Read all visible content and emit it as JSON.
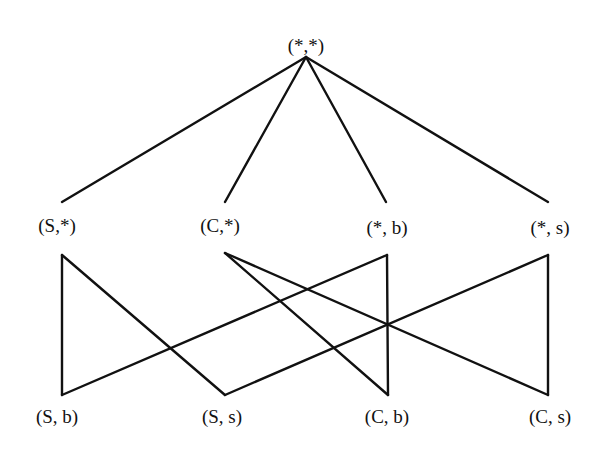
{
  "diagram": {
    "type": "lattice",
    "levels": [
      {
        "name": "top",
        "nodes": [
          {
            "id": "top",
            "label": "(*,*)",
            "x": 306,
            "label_y": 52,
            "attach_bottom_y": 57
          }
        ]
      },
      {
        "name": "middle",
        "nodes": [
          {
            "id": "S_any",
            "label": "(S,*)",
            "x": 62,
            "label_y": 232,
            "attach_top_y": 202,
            "attach_bottom_y": 255
          },
          {
            "id": "C_any",
            "label": "(C,*)",
            "x": 225,
            "label_y": 232,
            "attach_top_y": 202,
            "attach_bottom_y": 255
          },
          {
            "id": "any_b",
            "label": "(*, b)",
            "x": 387,
            "label_y": 234,
            "attach_top_y": 202,
            "attach_bottom_y": 255
          },
          {
            "id": "any_s",
            "label": "(*, s)",
            "x": 548,
            "label_y": 234,
            "attach_top_y": 202,
            "attach_bottom_y": 255
          }
        ]
      },
      {
        "name": "bottom",
        "nodes": [
          {
            "id": "S_b",
            "label": "(S, b)",
            "x": 62,
            "label_y": 423,
            "attach_top_y": 395
          },
          {
            "id": "S_s",
            "label": "(S, s)",
            "x": 225,
            "label_y": 423,
            "attach_top_y": 395
          },
          {
            "id": "C_b",
            "label": "(C, b)",
            "x": 388,
            "label_y": 423,
            "attach_top_y": 395
          },
          {
            "id": "C_s",
            "label": "(C, s)",
            "x": 548,
            "label_y": 423,
            "attach_top_y": 395
          }
        ]
      }
    ],
    "edges": [
      {
        "from": "top",
        "to": "S_any"
      },
      {
        "from": "top",
        "to": "C_any"
      },
      {
        "from": "top",
        "to": "any_b"
      },
      {
        "from": "top",
        "to": "any_s"
      },
      {
        "from": "S_any",
        "to": "S_b"
      },
      {
        "from": "S_any",
        "to": "S_s"
      },
      {
        "from": "C_any",
        "to": "C_b"
      },
      {
        "from": "C_any",
        "to": "C_s"
      },
      {
        "from": "any_b",
        "to": "S_b"
      },
      {
        "from": "any_b",
        "to": "C_b"
      },
      {
        "from": "any_s",
        "to": "S_s"
      },
      {
        "from": "any_s",
        "to": "C_s"
      }
    ]
  },
  "labels": {
    "top": "(*,*)",
    "S_any": "(S,*)",
    "C_any": "(C,*)",
    "any_b": "(*, b)",
    "any_s": "(*, s)",
    "S_b": "(S, b)",
    "S_s": "(S, s)",
    "C_b": "(C, b)",
    "C_s": "(C, s)"
  },
  "colors": {
    "line": "#111111",
    "text": "#111111",
    "background": "#ffffff"
  }
}
